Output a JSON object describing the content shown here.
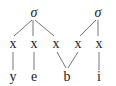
{
  "diagram": {
    "type": "syllable-structure",
    "syllables": [
      {
        "label": "σ",
        "x": 34,
        "y": 13
      },
      {
        "label": "σ",
        "x": 98,
        "y": 13
      }
    ],
    "timing_slots": [
      {
        "label": "x",
        "x": 13,
        "y": 44
      },
      {
        "label": "x",
        "x": 34,
        "y": 44
      },
      {
        "label": "x",
        "x": 56,
        "y": 44
      },
      {
        "label": "x",
        "x": 78,
        "y": 44
      },
      {
        "label": "x",
        "x": 99,
        "y": 44
      }
    ],
    "segments": [
      {
        "label": "y",
        "x": 13,
        "y": 78
      },
      {
        "label": "e",
        "x": 34,
        "y": 78
      },
      {
        "label": "b",
        "x": 67,
        "y": 78
      },
      {
        "label": "i",
        "x": 99,
        "y": 78
      }
    ],
    "edges": [
      {
        "from": "syllable-0",
        "to": "slot-0"
      },
      {
        "from": "syllable-0",
        "to": "slot-1"
      },
      {
        "from": "syllable-0",
        "to": "slot-2"
      },
      {
        "from": "syllable-1",
        "to": "slot-3"
      },
      {
        "from": "syllable-1",
        "to": "slot-4"
      },
      {
        "from": "slot-0",
        "to": "segment-0"
      },
      {
        "from": "slot-1",
        "to": "segment-1"
      },
      {
        "from": "slot-2",
        "to": "segment-2"
      },
      {
        "from": "slot-3",
        "to": "segment-2"
      },
      {
        "from": "slot-4",
        "to": "segment-3"
      }
    ],
    "line_color": "#777777"
  }
}
